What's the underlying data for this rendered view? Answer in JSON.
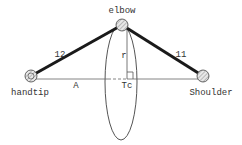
{
  "diagram": {
    "joints": {
      "elbow": {
        "label": "elbow"
      },
      "handtip": {
        "label": "handtip"
      },
      "shoulder": {
        "label": "Shoulder"
      }
    },
    "segments": {
      "forearm": {
        "label": "12"
      },
      "upper_arm": {
        "label": "11"
      }
    },
    "annotations": {
      "radius": "r",
      "axis": "A",
      "center": "Tc"
    },
    "colors": {
      "link": "#1a1a1a",
      "thin_line": "#555555",
      "joint_fill": "#bbbbbb",
      "background": "#ffffff"
    }
  }
}
